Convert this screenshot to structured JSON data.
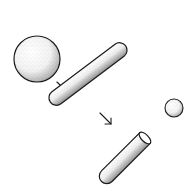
{
  "diagram": {
    "colors": {
      "stroke": "#1a1a1a",
      "fill": "#ffffff",
      "stipple": "#333333"
    },
    "elements": [
      {
        "name": "large-sphere",
        "shape": "circle"
      },
      {
        "name": "arrow-1",
        "shape": "arrow",
        "direction": "down-right"
      },
      {
        "name": "long-rod",
        "shape": "capsule"
      },
      {
        "name": "arrow-2",
        "shape": "arrow",
        "direction": "down-right"
      },
      {
        "name": "short-cut-rod",
        "shape": "cylinder-open-end"
      },
      {
        "name": "small-sphere",
        "shape": "circle"
      }
    ]
  }
}
